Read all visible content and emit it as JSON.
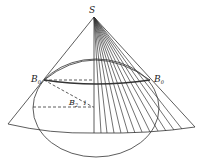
{
  "diagram": {
    "type": "geometry-figure",
    "labels": {
      "apex": "S",
      "left_point": "B",
      "left_point_sub": "0",
      "right_point": "B",
      "right_point_sub": "0",
      "inner_point": "B",
      "inner_point_sub": "2",
      "angle_mark": "1"
    },
    "colors": {
      "stroke": "#333333",
      "background": "#ffffff"
    }
  }
}
